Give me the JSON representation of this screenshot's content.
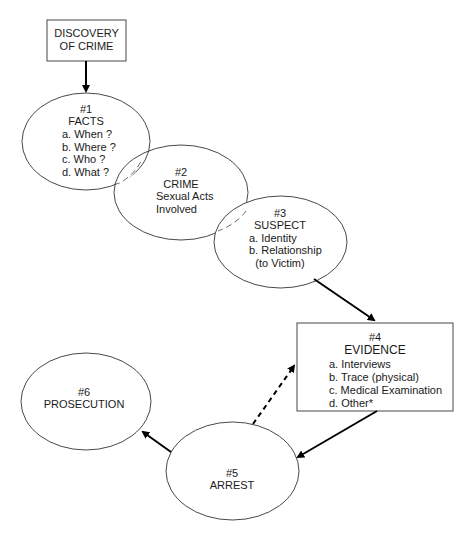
{
  "diagram": {
    "discovery": {
      "lines": [
        "DISCOVERY",
        "OF CRIME"
      ]
    },
    "facts": {
      "lines": [
        "#1",
        "FACTS",
        "a. When ?",
        "b. Where ?",
        "c. Who ?",
        "d. What ?"
      ]
    },
    "crime": {
      "lines": [
        "#2",
        "CRIME",
        "Sexual Acts",
        "Involved"
      ]
    },
    "suspect": {
      "lines": [
        "#3",
        "SUSPECT",
        "a. Identity",
        "b. Relationship",
        "(to Victim)"
      ]
    },
    "evidence": {
      "lines": [
        "#4",
        "EVIDENCE",
        "a. Interviews",
        "b. Trace (physical)",
        "c. Medical Examination",
        "d. Other*"
      ]
    },
    "arrest": {
      "lines": [
        "#5",
        "ARREST"
      ]
    },
    "prosecution": {
      "lines": [
        "#6",
        "PROSECUTION"
      ]
    },
    "edges": [
      {
        "from": "discovery",
        "to": "facts",
        "style": "solid"
      },
      {
        "from": "suspect",
        "to": "evidence",
        "style": "solid"
      },
      {
        "from": "evidence",
        "to": "arrest",
        "style": "solid"
      },
      {
        "from": "arrest",
        "to": "evidence",
        "style": "dashed"
      },
      {
        "from": "arrest",
        "to": "prosecution",
        "style": "solid"
      }
    ]
  }
}
